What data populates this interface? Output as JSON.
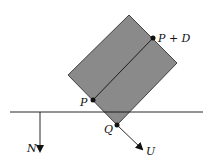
{
  "diagram": {
    "labels": {
      "p": "P",
      "p_plus_d": "P + D",
      "q": "Q",
      "n": "N",
      "u": "U"
    },
    "colors": {
      "box_fill": "#8a8a8a",
      "stroke": "#111111",
      "background": "#ffffff"
    }
  }
}
